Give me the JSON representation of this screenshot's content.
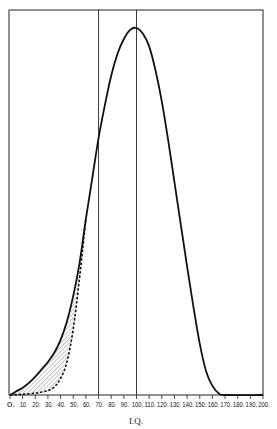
{
  "chart_data": {
    "type": "line",
    "title": "",
    "xlabel": "I.Q.",
    "ylabel": "",
    "xlim": [
      0,
      200
    ],
    "ylim": [
      0,
      100
    ],
    "grid": false,
    "x_ticks": [
      "0.",
      "10.",
      "20.",
      "30.",
      "40.",
      "50.",
      "60.",
      "70.",
      "80.",
      "90.",
      "100.",
      "110.",
      "120.",
      "130.",
      "140.",
      "150.",
      "160.",
      "170.",
      "180.",
      "190.",
      "200."
    ],
    "x_tick_values": [
      0,
      10,
      20,
      30,
      40,
      50,
      60,
      70,
      80,
      90,
      100,
      110,
      120,
      130,
      140,
      150,
      160,
      170,
      180,
      190,
      200
    ],
    "reference_lines": [
      70,
      100
    ],
    "series": [
      {
        "name": "observed distribution",
        "style": "solid",
        "x": [
          0,
          5,
          10,
          15,
          20,
          25,
          30,
          35,
          40,
          45,
          50,
          55,
          60,
          65,
          70,
          75,
          80,
          85,
          90,
          95,
          100,
          105,
          110,
          115,
          120,
          125,
          130,
          135,
          140,
          145,
          150,
          155,
          160,
          165,
          170,
          200
        ],
        "y": [
          0,
          1,
          2,
          3.3,
          5,
          7,
          9,
          11.5,
          15,
          20,
          27,
          36,
          48,
          59,
          70,
          79,
          87,
          93,
          97,
          99.5,
          100,
          98.5,
          95,
          88.5,
          80,
          69.5,
          58,
          46.5,
          35,
          24,
          14,
          6.5,
          2.5,
          0.5,
          0,
          0
        ]
      },
      {
        "name": "normal distribution",
        "style": "dashed",
        "x": [
          0,
          10,
          20,
          25,
          30,
          35,
          40,
          45,
          50,
          55,
          60
        ],
        "y": [
          0,
          0.2,
          0.5,
          0.8,
          1.2,
          2.2,
          4.5,
          9,
          18,
          32,
          48
        ]
      }
    ],
    "shaded_region": {
      "between": [
        "normal distribution",
        "observed distribution"
      ],
      "x_range": [
        0,
        60
      ],
      "pattern": "diagonal hatch"
    }
  }
}
